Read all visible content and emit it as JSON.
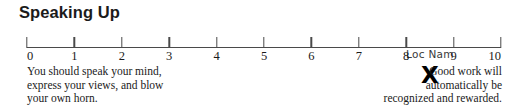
{
  "title": "Speaking Up",
  "scale": {
    "min": 0,
    "max": 10,
    "tick_labels": [
      "0",
      "1",
      "2",
      "3",
      "4",
      "5",
      "6",
      "7",
      "8",
      "9",
      "10"
    ]
  },
  "mark": {
    "glyph": "X",
    "label": "Loc Nam",
    "value": 8.5
  },
  "caption_left": {
    "line1": "You should speak your mind,",
    "line2": "express your views, and blow",
    "line3": "your own horn."
  },
  "caption_right": {
    "line1": "Good work will",
    "line2": "automatically be",
    "line3": "recognized and rewarded."
  },
  "colors": {
    "axis": "#4a4a4a",
    "text": "#1a1a1a",
    "mark": "#000000",
    "background": "#ffffff"
  }
}
